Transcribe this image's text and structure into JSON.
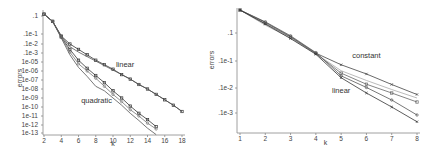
{
  "chart_data": [
    {
      "type": "line",
      "title": "",
      "xlabel": "k",
      "ylabel": "errors",
      "yscale": "log",
      "xlim": [
        2,
        18
      ],
      "x_ticks": [
        2,
        4,
        6,
        8,
        10,
        12,
        14,
        16,
        18
      ],
      "y_ticks": [
        {
          "exp": -1,
          "label": ".1"
        },
        {
          "exp": -2,
          "label": ".1e-1"
        },
        {
          "exp": -3,
          "label": ".1e-2"
        },
        {
          "exp": -4,
          "label": ".1e-3"
        },
        {
          "exp": -5,
          "label": "1e-05"
        },
        {
          "exp": -6,
          "label": "1e-06"
        },
        {
          "exp": -7,
          "label": "1e-07"
        },
        {
          "exp": -8,
          "label": "1e-08"
        },
        {
          "exp": -9,
          "label": "1e-09"
        },
        {
          "exp": -10,
          "label": "1e-10"
        },
        {
          "exp": -11,
          "label": "1e-11"
        },
        {
          "exp": -12,
          "label": "1e-12"
        },
        {
          "exp": -13,
          "label": "1e-13"
        }
      ],
      "value_units": "log10(error)",
      "annotations": [
        {
          "text": "linear",
          "x": 11.4,
          "y": -5.6
        },
        {
          "text": "quadratic",
          "x": 8.1,
          "y": -9.5
        }
      ],
      "series": [
        {
          "name": "linear-a",
          "marker": "square",
          "color": "#333333",
          "x": [
            2,
            3,
            4,
            5,
            6,
            7,
            8,
            9,
            10,
            11,
            12,
            13,
            14,
            15,
            16,
            17,
            18
          ],
          "values": [
            -0.9,
            -1.3,
            -2.2,
            -3.0,
            -3.6,
            -4.2,
            -4.8,
            -5.3,
            -5.8,
            -6.4,
            -6.9,
            -7.5,
            -8.0,
            -8.6,
            -9.2,
            -9.8,
            -10.5
          ]
        },
        {
          "name": "linear-b",
          "marker": "none",
          "color": "#555555",
          "x": [
            2,
            3,
            4,
            5,
            6,
            7,
            8,
            9,
            10,
            11,
            12,
            13,
            14,
            15,
            16,
            17,
            18
          ],
          "values": [
            -0.9,
            -1.3,
            -2.2,
            -3.3,
            -3.9,
            -4.4,
            -4.9,
            -5.4,
            -5.9,
            -6.4,
            -6.9,
            -7.5,
            -8.0,
            -8.6,
            -9.2,
            -9.8,
            -10.5
          ]
        },
        {
          "name": "quadratic-a",
          "marker": "square",
          "color": "#333333",
          "x": [
            2,
            3,
            4,
            5,
            6,
            7,
            8,
            9,
            10,
            11,
            12,
            13,
            14,
            15
          ],
          "values": [
            -0.9,
            -1.3,
            -2.3,
            -3.6,
            -4.8,
            -5.7,
            -6.5,
            -7.3,
            -8.2,
            -9.0,
            -9.9,
            -10.7,
            -11.4,
            -12.2
          ]
        },
        {
          "name": "quadratic-b",
          "marker": "circle",
          "color": "#777777",
          "x": [
            2,
            3,
            4,
            5,
            6,
            7,
            8,
            9,
            10,
            11,
            12,
            13,
            14,
            15
          ],
          "values": [
            -0.9,
            -1.3,
            -2.3,
            -3.9,
            -5.2,
            -6.0,
            -6.8,
            -7.7,
            -8.6,
            -9.4,
            -10.3,
            -11.0,
            -11.8,
            -12.5
          ]
        },
        {
          "name": "quadratic-c",
          "marker": "none",
          "color": "#555555",
          "x": [
            2,
            3,
            4,
            5,
            6,
            7,
            8,
            9,
            10,
            11,
            12,
            13,
            14,
            15
          ],
          "values": [
            -0.9,
            -1.3,
            -2.4,
            -4.2,
            -5.6,
            -6.6,
            -7.7,
            -8.2,
            -9.0,
            -9.8,
            -10.7,
            -11.5,
            -12.4,
            -13.2
          ]
        }
      ]
    },
    {
      "type": "line",
      "title": "",
      "xlabel": "k",
      "ylabel": "errors",
      "yscale": "log",
      "xlim": [
        1,
        8
      ],
      "x_ticks": [
        1,
        2,
        3,
        4,
        5,
        6,
        7,
        8
      ],
      "y_ticks": [
        {
          "exp": -1,
          "label": ".1"
        },
        {
          "exp": -2,
          "label": ".1e-1"
        },
        {
          "exp": -3,
          "label": ".1e-2"
        },
        {
          "exp": -4,
          "label": ".1e-3"
        }
      ],
      "value_units": "log10(error)",
      "annotations": [
        {
          "text": "constant",
          "x": 6.0,
          "y": -1.9
        },
        {
          "text": "linear",
          "x": 5.0,
          "y": -3.2
        }
      ],
      "series": [
        {
          "name": "constant",
          "marker": "cross",
          "color": "#444444",
          "x": [
            1,
            2,
            3,
            4,
            5,
            6,
            7,
            8
          ],
          "values": [
            -0.18,
            -0.62,
            -1.13,
            -1.72,
            -2.14,
            -2.48,
            -2.87,
            -3.26
          ]
        },
        {
          "name": "mid-1",
          "marker": "none",
          "color": "#aaaaaa",
          "x": [
            1,
            2,
            3,
            4,
            5,
            6,
            7,
            8
          ],
          "values": [
            -0.18,
            -0.72,
            -1.18,
            -1.74,
            -2.36,
            -2.72,
            -3.06,
            -3.4
          ]
        },
        {
          "name": "mid-2",
          "marker": "square",
          "color": "#666666",
          "x": [
            1,
            2,
            3,
            4,
            5,
            6,
            7,
            8
          ],
          "values": [
            -0.18,
            -0.66,
            -1.15,
            -1.73,
            -2.45,
            -2.86,
            -3.2,
            -3.56
          ]
        },
        {
          "name": "mid-3",
          "marker": "circle",
          "color": "#555555",
          "x": [
            1,
            2,
            3,
            4,
            5,
            6,
            7,
            8
          ],
          "values": [
            -0.18,
            -0.6,
            -1.1,
            -1.7,
            -2.55,
            -2.98,
            -3.48,
            -4.08
          ]
        },
        {
          "name": "linear",
          "marker": "cross",
          "color": "#333333",
          "x": [
            1,
            2,
            3,
            4,
            5,
            6,
            7,
            8
          ],
          "values": [
            -0.18,
            -0.68,
            -1.2,
            -1.76,
            -2.62,
            -3.2,
            -3.76,
            -4.35
          ]
        }
      ]
    }
  ]
}
